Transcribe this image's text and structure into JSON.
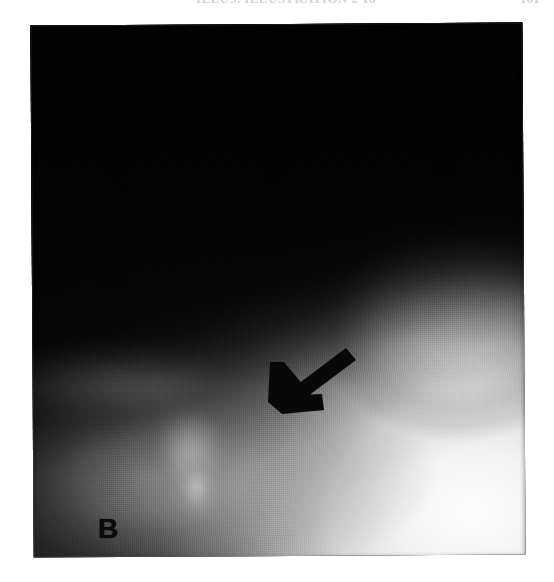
{
  "page_header": {
    "running_head": "ILLUS. ILLUSTRATION 2 16",
    "page_number": "161",
    "note": "cropped running head, only lowest pixel row of glyphs visible"
  },
  "figure": {
    "caption_label": "B",
    "modality": "radiograph",
    "annotations": [
      {
        "type": "arrow",
        "name": "annotation-arrow",
        "color": "#080808",
        "direction": "down-left",
        "tail_x": 320,
        "tail_y": 332,
        "head_x": 248,
        "head_y": 388
      },
      {
        "type": "text",
        "name": "panel-label",
        "text": "B",
        "color": "#0b0b0b",
        "x": 70,
        "y": 496
      }
    ],
    "plate": {
      "x": 32,
      "y": 24,
      "width": 492,
      "height": 532,
      "background_color": "#050505",
      "highlight_color": "#ffffff"
    }
  }
}
